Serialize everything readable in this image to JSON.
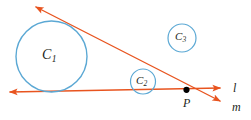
{
  "figure": {
    "type": "euclidean-geometry-diagram",
    "canvas": {
      "width": 251,
      "height": 120,
      "background": "#ffffff"
    },
    "colors": {
      "circle_stroke": "#5ba8d4",
      "line_stroke": "#e8541f",
      "point_fill": "#000000",
      "label_text": "#231f20"
    },
    "circles": [
      {
        "id": "C1",
        "label": "C",
        "subscript": "1",
        "cx": 51.5,
        "cy": 56.5,
        "r": 35.5,
        "stroke_width": 1.4
      },
      {
        "id": "C2",
        "label": "C",
        "subscript": "2",
        "cx": 143,
        "cy": 81.5,
        "r": 12.5,
        "stroke_width": 1.2
      },
      {
        "id": "C3",
        "label": "C",
        "subscript": "3",
        "cx": 182,
        "cy": 38,
        "r": 14,
        "stroke_width": 1.2
      }
    ],
    "lines": [
      {
        "id": "l",
        "label": "l",
        "orientation": "horizontal",
        "x1": 10,
        "y1": 92,
        "x2": 220,
        "y2": 88,
        "arrows": "both",
        "stroke_width": 1.4
      },
      {
        "id": "m",
        "label": "m",
        "orientation": "diagonal",
        "x1": 36,
        "y1": 7,
        "x2": 220,
        "y2": 101,
        "arrows": "both",
        "stroke_width": 1.4
      }
    ],
    "points": [
      {
        "id": "P",
        "label": "P",
        "x": 186.5,
        "y": 89.8,
        "r": 3.1
      }
    ]
  }
}
